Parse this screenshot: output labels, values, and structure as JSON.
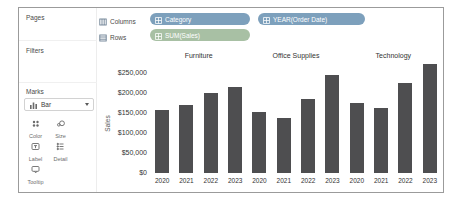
{
  "sidebar": {
    "pages_label": "Pages",
    "filters_label": "Filters",
    "marks_label": "Marks",
    "mark_type": "Bar",
    "mark_type_icon": "bar-mark-icon",
    "buttons": [
      {
        "label": "Color",
        "icon": "color-icon"
      },
      {
        "label": "Size",
        "icon": "size-icon"
      },
      {
        "label": "Label",
        "icon": "label-icon"
      },
      {
        "label": "Detail",
        "icon": "detail-icon"
      },
      {
        "label": "Tooltip",
        "icon": "tooltip-icon"
      }
    ]
  },
  "shelves": {
    "columns_label": "Columns",
    "rows_label": "Rows",
    "columns_pills": [
      {
        "label": "Category",
        "type": "dimension",
        "icon": "grid-icon",
        "width": 100
      },
      {
        "label": "YEAR(Order Date)",
        "type": "dimension",
        "icon": "grid-icon",
        "width": 107
      }
    ],
    "rows_pills": [
      {
        "label": "SUM(Sales)",
        "type": "measure",
        "icon": "grid-icon",
        "width": 100
      }
    ]
  },
  "chart_data": {
    "type": "bar",
    "title": "",
    "xlabel": "",
    "ylabel": "Sales",
    "panels": [
      "Furniture",
      "Office Supplies",
      "Technology"
    ],
    "categories": [
      "2020",
      "2021",
      "2022",
      "2023"
    ],
    "series": [
      {
        "name": "Furniture",
        "values": [
          157193,
          170518,
          198901,
          215387
        ]
      },
      {
        "name": "Office Supplies",
        "values": [
          151776,
          137233,
          183940,
          246097
        ]
      },
      {
        "name": "Technology",
        "values": [
          175278,
          162781,
          226364,
          271730
        ]
      }
    ],
    "yticks": [
      "$250,000",
      "$200,000",
      "$150,000",
      "$100,000",
      "$50,000",
      "$0"
    ],
    "ylim": [
      0,
      277500
    ],
    "grid": false,
    "legend": "none",
    "bar_color": "#4e4e50"
  },
  "colors": {
    "dimension_pill": "#7da0bc",
    "measure_pill": "#a8c0a4",
    "bar": "#4e4e50",
    "frame_border": "#9b9b9b"
  }
}
